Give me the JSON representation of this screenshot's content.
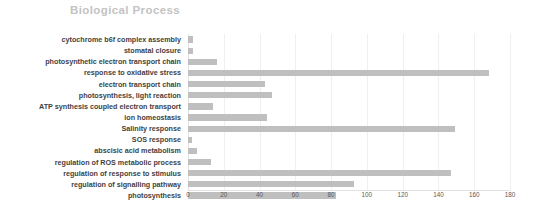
{
  "chart_data": {
    "type": "bar",
    "orientation": "horizontal",
    "title": "Biological Process",
    "xlabel": "",
    "ylabel": "",
    "xlim": [
      0,
      180
    ],
    "xticks": [
      0,
      20,
      40,
      60,
      80,
      100,
      120,
      140,
      160,
      180
    ],
    "grid": true,
    "legend": false,
    "bar_color": "#bfbfbf",
    "title_color": "#c3c3c3",
    "categories": [
      "cytochrome b6f complex assembly",
      "stomatal closure",
      "photosynthetic electron transport chain",
      "response to oxidative stress",
      "electron transport chain",
      "photosynthesis, light reaction",
      "ATP synthesis coupled electron transport",
      "ion homeostasis",
      "Salinity response",
      "SOS response",
      "abscisic acid metabolism",
      "regulation of ROS metabolic process",
      "regulation of response to stimulus",
      "regulation of signalling pathway",
      "photosynthesis"
    ],
    "values": [
      3,
      3,
      16,
      168,
      43,
      47,
      14,
      44,
      149,
      2,
      5,
      13,
      147,
      93,
      83
    ]
  }
}
